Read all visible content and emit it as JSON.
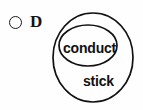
{
  "figure": {
    "name": "nested-venn-diagram",
    "option": {
      "marker_icon": "circle-outline-icon",
      "letter": "D"
    },
    "sets": {
      "outer": {
        "label": "stick",
        "role": "superset"
      },
      "inner": {
        "label": "conduct",
        "role": "subset"
      }
    },
    "colors": {
      "stroke": "#111111",
      "background": "#fefefe",
      "text": "#111111"
    }
  }
}
